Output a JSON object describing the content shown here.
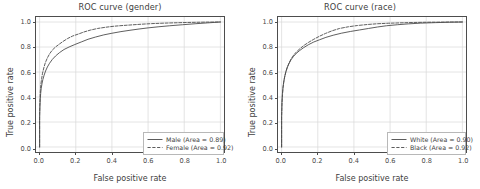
{
  "figure": {
    "width": 480,
    "height": 189,
    "background": "#ffffff",
    "grid_color": "#d8d8d8",
    "axis_color": "#4d4d4d",
    "text_color": "#404040",
    "solid_curve_color": "#4a4a4a",
    "dashed_curve_color": "#4a4a4a"
  },
  "chart_data": [
    {
      "type": "line",
      "title": "ROC curve (gender)",
      "xlabel": "False positive rate",
      "ylabel": "True positive rate",
      "xlim": [
        -0.02,
        1.02
      ],
      "ylim": [
        -0.04,
        1.04
      ],
      "xticks": [
        "0.0",
        "0.2",
        "0.4",
        "0.6",
        "0.8",
        "1.0"
      ],
      "yticks": [
        "0.0",
        "0.2",
        "0.4",
        "0.6",
        "0.8",
        "1.0"
      ],
      "xtick_values": [
        0.0,
        0.2,
        0.4,
        0.6,
        0.8,
        1.0
      ],
      "ytick_values": [
        0.0,
        0.2,
        0.4,
        0.6,
        0.8,
        1.0
      ],
      "grid": true,
      "legend_position": "lower right",
      "series": [
        {
          "name": "Male (Area = 0.89)",
          "label": "Male (Area = 0.89)",
          "area": 0.89,
          "style": "solid",
          "color": "#4a4a4a",
          "x": [
            0.0,
            0.0,
            0.002,
            0.004,
            0.006,
            0.009,
            0.013,
            0.018,
            0.025,
            0.033,
            0.043,
            0.055,
            0.07,
            0.088,
            0.11,
            0.135,
            0.163,
            0.195,
            0.23,
            0.268,
            0.31,
            0.355,
            0.4,
            0.45,
            0.5,
            0.55,
            0.6,
            0.66,
            0.72,
            0.79,
            0.86,
            0.93,
            1.0
          ],
          "y": [
            0.0,
            0.23,
            0.33,
            0.39,
            0.43,
            0.47,
            0.505,
            0.54,
            0.575,
            0.608,
            0.64,
            0.67,
            0.7,
            0.728,
            0.755,
            0.78,
            0.8,
            0.82,
            0.84,
            0.862,
            0.88,
            0.897,
            0.91,
            0.923,
            0.934,
            0.944,
            0.953,
            0.962,
            0.97,
            0.978,
            0.986,
            0.993,
            1.0
          ]
        },
        {
          "name": "Female (Area = 0.92)",
          "label": "Female (Area = 0.92)",
          "area": 0.92,
          "style": "dashed",
          "color": "#4a4a4a",
          "x": [
            0.0,
            0.0,
            0.002,
            0.004,
            0.007,
            0.011,
            0.016,
            0.023,
            0.031,
            0.042,
            0.055,
            0.07,
            0.088,
            0.108,
            0.13,
            0.155,
            0.183,
            0.213,
            0.245,
            0.28,
            0.32,
            0.365,
            0.41,
            0.46,
            0.51,
            0.56,
            0.62,
            0.69,
            0.76,
            0.84,
            0.92,
            1.0
          ],
          "y": [
            0.0,
            0.26,
            0.38,
            0.45,
            0.5,
            0.545,
            0.59,
            0.632,
            0.672,
            0.71,
            0.745,
            0.775,
            0.8,
            0.822,
            0.845,
            0.868,
            0.888,
            0.903,
            0.92,
            0.935,
            0.948,
            0.958,
            0.966,
            0.972,
            0.977,
            0.982,
            0.987,
            0.991,
            0.994,
            0.997,
            0.999,
            1.0
          ]
        }
      ]
    },
    {
      "type": "line",
      "title": "ROC curve (race)",
      "xlabel": "False positive rate",
      "ylabel": "True positive rate",
      "xlim": [
        -0.02,
        1.02
      ],
      "ylim": [
        -0.04,
        1.04
      ],
      "xticks": [
        "0.0",
        "0.2",
        "0.4",
        "0.6",
        "0.8",
        "1.0"
      ],
      "yticks": [
        "0.0",
        "0.2",
        "0.4",
        "0.6",
        "0.8",
        "1.0"
      ],
      "xtick_values": [
        0.0,
        0.2,
        0.4,
        0.6,
        0.8,
        1.0
      ],
      "ytick_values": [
        0.0,
        0.2,
        0.4,
        0.6,
        0.8,
        1.0
      ],
      "grid": true,
      "legend_position": "lower right",
      "series": [
        {
          "name": "White (Area = 0.90)",
          "label": "White (Area = 0.90)",
          "area": 0.9,
          "style": "solid",
          "color": "#4a4a4a",
          "x": [
            0.0,
            0.0,
            0.002,
            0.004,
            0.007,
            0.011,
            0.016,
            0.022,
            0.03,
            0.04,
            0.052,
            0.066,
            0.082,
            0.1,
            0.122,
            0.148,
            0.178,
            0.21,
            0.245,
            0.285,
            0.33,
            0.38,
            0.43,
            0.48,
            0.53,
            0.58,
            0.64,
            0.7,
            0.77,
            0.85,
            0.925,
            1.0
          ],
          "y": [
            0.0,
            0.25,
            0.36,
            0.42,
            0.47,
            0.515,
            0.555,
            0.595,
            0.632,
            0.665,
            0.698,
            0.725,
            0.75,
            0.772,
            0.795,
            0.818,
            0.84,
            0.858,
            0.877,
            0.894,
            0.91,
            0.924,
            0.936,
            0.948,
            0.96,
            0.97,
            0.978,
            0.985,
            0.991,
            0.995,
            0.998,
            1.0
          ]
        },
        {
          "name": "Black (Area = 0.92)",
          "label": "Black (Area = 0.92)",
          "area": 0.92,
          "style": "dashed",
          "color": "#4a4a4a",
          "x": [
            0.0,
            0.0,
            0.002,
            0.005,
            0.008,
            0.012,
            0.017,
            0.024,
            0.032,
            0.042,
            0.054,
            0.068,
            0.085,
            0.104,
            0.126,
            0.15,
            0.178,
            0.208,
            0.242,
            0.28,
            0.32,
            0.37,
            0.42,
            0.475,
            0.53,
            0.59,
            0.655,
            0.725,
            0.8,
            0.875,
            0.94,
            1.0
          ],
          "y": [
            0.0,
            0.23,
            0.35,
            0.42,
            0.475,
            0.52,
            0.562,
            0.602,
            0.64,
            0.675,
            0.708,
            0.738,
            0.765,
            0.79,
            0.815,
            0.838,
            0.862,
            0.885,
            0.908,
            0.93,
            0.948,
            0.962,
            0.972,
            0.98,
            0.986,
            0.99,
            0.993,
            0.996,
            0.998,
            0.999,
            1.0,
            1.0
          ]
        }
      ]
    }
  ]
}
